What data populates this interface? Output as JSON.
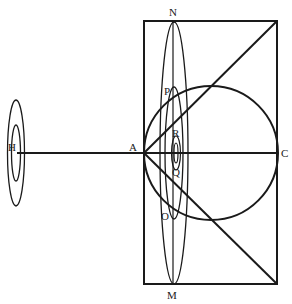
{
  "diagram": {
    "type": "geometric-optics-diagram",
    "colors": {
      "ink": "#1a1a1a",
      "background": "#ffffff"
    },
    "labels": {
      "H": "H",
      "A": "A",
      "C": "C",
      "N": "N",
      "M": "M",
      "P": "P",
      "R": "R",
      "Q": "Q",
      "O": "O"
    },
    "shapes": {
      "rectangle": {
        "x1": 144,
        "y1": 21,
        "x2": 277,
        "y2": 284
      },
      "circle": {
        "cx": 211,
        "cy": 153,
        "r": 67
      },
      "horizontal_line": {
        "from": "H",
        "to": "C"
      },
      "diagonals": [
        "A to top-right corner",
        "A to bottom-right corner"
      ],
      "ellipses_near_A": [
        "N–M outer ellipse",
        "P–O middle ellipse",
        "R–Q inner ellipses"
      ],
      "ellipses_at_H": [
        "outer",
        "inner"
      ]
    }
  }
}
